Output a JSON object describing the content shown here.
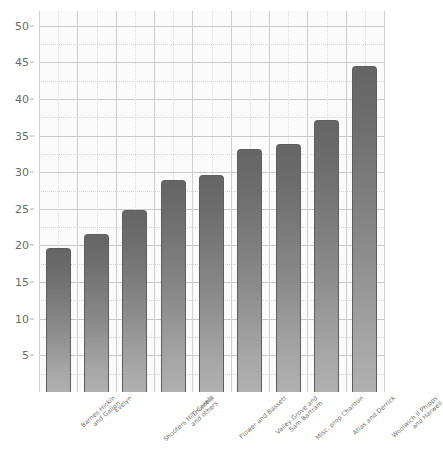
{
  "chart_data": {
    "type": "bar",
    "title": "",
    "xlabel": "",
    "ylabel": "",
    "ylim": [
      0,
      52
    ],
    "ytick_values": [
      50,
      45,
      40,
      35,
      30,
      25,
      20,
      15,
      10,
      5
    ],
    "ytick_labels": [
      "50",
      "45",
      "40",
      "35",
      "30",
      "25",
      "20",
      "15",
      "10",
      "5"
    ],
    "minor_gridlines": true,
    "grid": true,
    "legend": "none",
    "categories": [
      "Barnes Hickin and Gallon",
      "Evelyn",
      "Shooters Hill, Corelli and others",
      "Thornhill",
      "Flower and Bassett",
      "Valley Grove and Sam Bartram",
      "Misc. prop Charlton",
      "Atlas and Derrick",
      "Woolwich II Phipps and Harwell"
    ],
    "category_lines": [
      [
        "Barnes Hickin",
        "and Gallon"
      ],
      [
        "Evelyn",
        ""
      ],
      [
        "Shooters Hill, Corelli",
        "and others"
      ],
      [
        "Thornhill",
        ""
      ],
      [
        "Flower and Bassett",
        ""
      ],
      [
        "Valley Grove and",
        "Sam Bartram"
      ],
      [
        "Misc. prop Charlton",
        ""
      ],
      [
        "Atlas and Derrick",
        ""
      ],
      [
        "Woolwich II Phipps",
        "and Harwell"
      ]
    ],
    "values": [
      19.7,
      21.5,
      24.9,
      28.9,
      29.6,
      33.1,
      33.9,
      37.1,
      44.5
    ],
    "bar_color_top": "#656565",
    "bar_color_bottom": "#b0b0b0",
    "plot_background": "#fbfbfb",
    "grid_color": "#c8c8c8"
  }
}
